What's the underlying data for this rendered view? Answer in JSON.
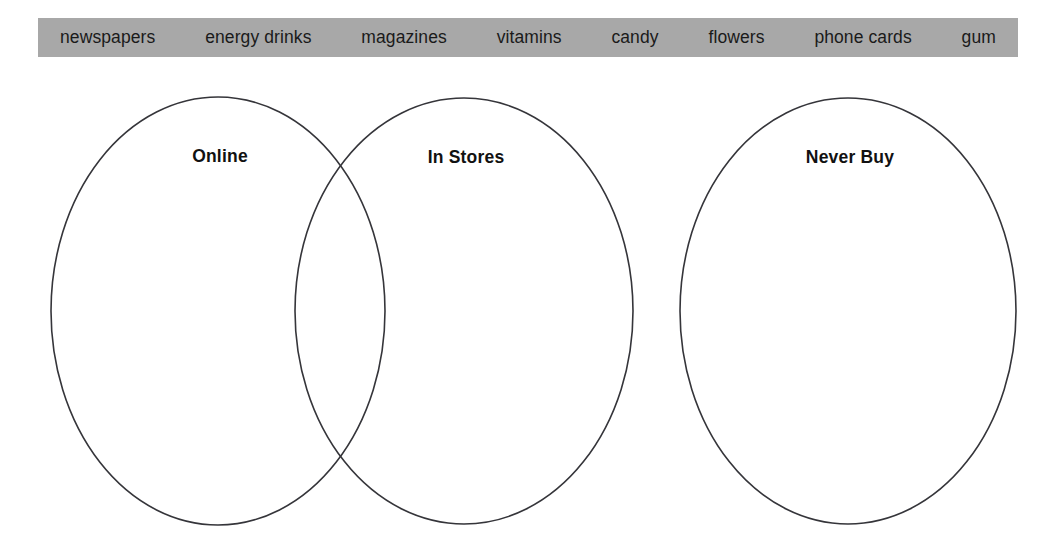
{
  "word_bank": {
    "background_color": "#a8a8a8",
    "items": [
      {
        "label": "newspapers"
      },
      {
        "label": "energy drinks"
      },
      {
        "label": "magazines"
      },
      {
        "label": "vitamins"
      },
      {
        "label": "candy"
      },
      {
        "label": "flowers"
      },
      {
        "label": "phone cards"
      },
      {
        "label": "gum"
      }
    ]
  },
  "venn": {
    "stroke_color": "#35353a",
    "circles": [
      {
        "label": "Online",
        "cx": 218,
        "cy": 311,
        "rx": 167,
        "ry": 214
      },
      {
        "label": "In Stores",
        "cx": 464,
        "cy": 311,
        "rx": 169,
        "ry": 213
      },
      {
        "label": "Never Buy",
        "cx": 848,
        "cy": 311,
        "rx": 168,
        "ry": 213
      }
    ]
  }
}
